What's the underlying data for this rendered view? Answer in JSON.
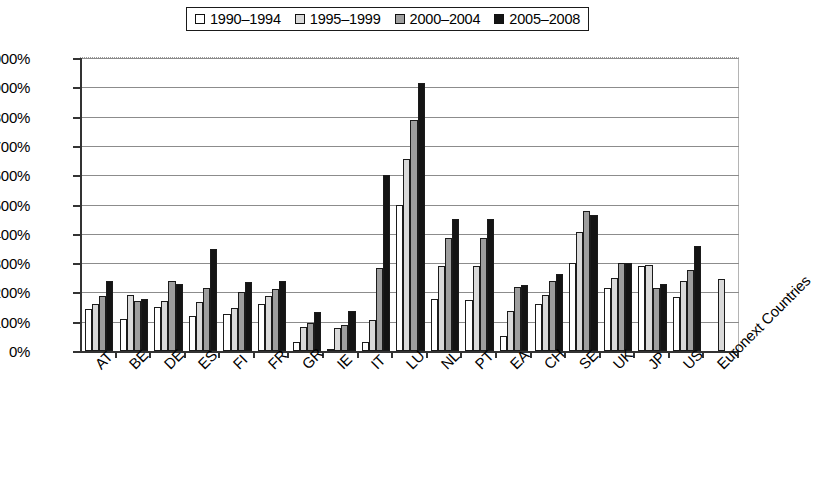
{
  "chart_data": {
    "type": "bar",
    "title": "",
    "subtitle": "",
    "xlabel": "",
    "ylabel": "",
    "ylim": [
      0,
      1000
    ],
    "ytick_labels": [
      "0%",
      "100%",
      "200%",
      "300%",
      "400%",
      "500%",
      "600%",
      "700%",
      "800%",
      "900%",
      "1000%"
    ],
    "ytick_values": [
      0,
      100,
      200,
      300,
      400,
      500,
      600,
      700,
      800,
      900,
      1000
    ],
    "grid": true,
    "legend_position": "top",
    "categories": [
      "AT",
      "BE",
      "DE",
      "ES",
      "FI",
      "FR",
      "GR",
      "IE",
      "IT",
      "LU",
      "NL",
      "PT",
      "EA",
      "CH",
      "SE",
      "UK",
      "JP",
      "US",
      "Euronext Countries"
    ],
    "series": [
      {
        "name": "1990–1994",
        "color": "#ffffff",
        "values": [
          142,
          108,
          150,
          120,
          128,
          162,
          30,
          5,
          30,
          500,
          178,
          175,
          50,
          160,
          300,
          215,
          290,
          185,
          null
        ]
      },
      {
        "name": "1995–1999",
        "color": "#d9d9d9",
        "values": [
          160,
          190,
          172,
          168,
          148,
          188,
          82,
          80,
          105,
          655,
          290,
          290,
          135,
          190,
          405,
          250,
          295,
          240,
          245
        ]
      },
      {
        "name": "2000–2004",
        "color": "#9e9e9e",
        "values": [
          188,
          172,
          240,
          215,
          200,
          212,
          95,
          90,
          285,
          790,
          385,
          385,
          220,
          240,
          477,
          300,
          215,
          278,
          null
        ]
      },
      {
        "name": "2005–2008",
        "color": "#141414",
        "values": [
          240,
          178,
          228,
          348,
          235,
          238,
          132,
          138,
          600,
          915,
          450,
          450,
          225,
          262,
          465,
          302,
          230,
          358,
          null
        ]
      }
    ]
  },
  "legend": {
    "items": [
      {
        "label": "1990–1994",
        "swatch": "#ffffff"
      },
      {
        "label": "1995–1999",
        "swatch": "#d9d9d9"
      },
      {
        "label": "2000–2004",
        "swatch": "#9e9e9e"
      },
      {
        "label": "2005–2008",
        "swatch": "#141414"
      }
    ]
  }
}
